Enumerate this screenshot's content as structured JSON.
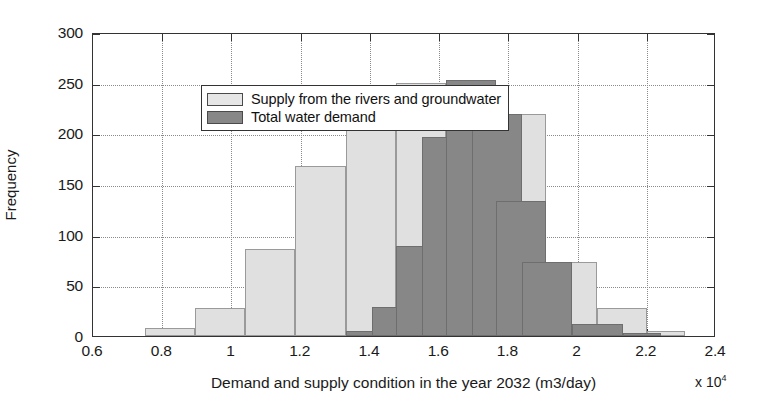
{
  "chart_data": {
    "type": "bar",
    "title": "",
    "xlabel": "Demand and supply condition in the year 2032 (m3/day)",
    "ylabel": "Frequency",
    "x_exponent_prefix": "x 10",
    "x_exponent_power": "4",
    "xlim": [
      0.6,
      2.4
    ],
    "ylim": [
      0,
      300
    ],
    "xticks": [
      "0.6",
      "0.8",
      "1",
      "1.2",
      "1.4",
      "1.6",
      "1.8",
      "2",
      "2.2",
      "2.4"
    ],
    "xtick_values": [
      0.6,
      0.8,
      1.0,
      1.2,
      1.4,
      1.6,
      1.8,
      2.0,
      2.2,
      2.4
    ],
    "yticks": [
      "0",
      "50",
      "100",
      "150",
      "200",
      "250",
      "300"
    ],
    "ytick_values": [
      0,
      50,
      100,
      150,
      200,
      250,
      300
    ],
    "grid": true,
    "legend_position": "upper-left",
    "overlap": "overlay",
    "series": [
      {
        "name": "Supply from the rivers and groundwater",
        "color": "#e0e0e0",
        "bin_edges": [
          0.75,
          0.895,
          1.04,
          1.185,
          1.33,
          1.475,
          1.62,
          1.765,
          1.91,
          2.055,
          2.2,
          2.31
        ],
        "values": [
          8,
          28,
          86,
          168,
          206,
          250,
          248,
          219,
          73,
          28,
          5
        ]
      },
      {
        "name": "Total  water demand",
        "color": "#878787",
        "bin_edges": [
          1.33,
          1.4,
          1.475,
          1.62,
          1.69,
          1.765,
          1.84,
          1.91,
          2.055,
          2.13,
          2.2,
          2.27
        ],
        "values": [
          5,
          29,
          89,
          196,
          253,
          219,
          133,
          73,
          12,
          3
        ]
      }
    ],
    "supply_bars": [
      {
        "x0": 0.75,
        "x1": 0.895,
        "value": 8
      },
      {
        "x0": 0.895,
        "x1": 1.04,
        "value": 28
      },
      {
        "x0": 1.04,
        "x1": 1.185,
        "value": 86
      },
      {
        "x0": 1.185,
        "x1": 1.33,
        "value": 168
      },
      {
        "x0": 1.33,
        "x1": 1.475,
        "value": 206
      },
      {
        "x0": 1.475,
        "x1": 1.62,
        "value": 250
      },
      {
        "x0": 1.62,
        "x1": 1.765,
        "value": 248
      },
      {
        "x0": 1.765,
        "x1": 1.91,
        "value": 219
      },
      {
        "x0": 1.91,
        "x1": 2.055,
        "value": 73
      },
      {
        "x0": 2.055,
        "x1": 2.2,
        "value": 28
      },
      {
        "x0": 2.2,
        "x1": 2.31,
        "value": 5
      }
    ],
    "demand_bars": [
      {
        "x0": 1.33,
        "x1": 1.475,
        "value": 5
      },
      {
        "x0": 1.405,
        "x1": 1.55,
        "value": 29
      },
      {
        "x0": 1.475,
        "x1": 1.62,
        "value": 89
      },
      {
        "x0": 1.55,
        "x1": 1.695,
        "value": 196
      },
      {
        "x0": 1.62,
        "x1": 1.765,
        "value": 253
      },
      {
        "x0": 1.695,
        "x1": 1.84,
        "value": 219
      },
      {
        "x0": 1.765,
        "x1": 1.91,
        "value": 133
      },
      {
        "x0": 1.84,
        "x1": 1.985,
        "value": 73
      },
      {
        "x0": 1.985,
        "x1": 2.13,
        "value": 12
      },
      {
        "x0": 2.13,
        "x1": 2.24,
        "value": 3
      }
    ]
  },
  "legend": {
    "items": [
      {
        "label": "Supply from the rivers and groundwater",
        "swatch": "supply"
      },
      {
        "label": "Total  water demand",
        "swatch": "demand"
      }
    ]
  }
}
